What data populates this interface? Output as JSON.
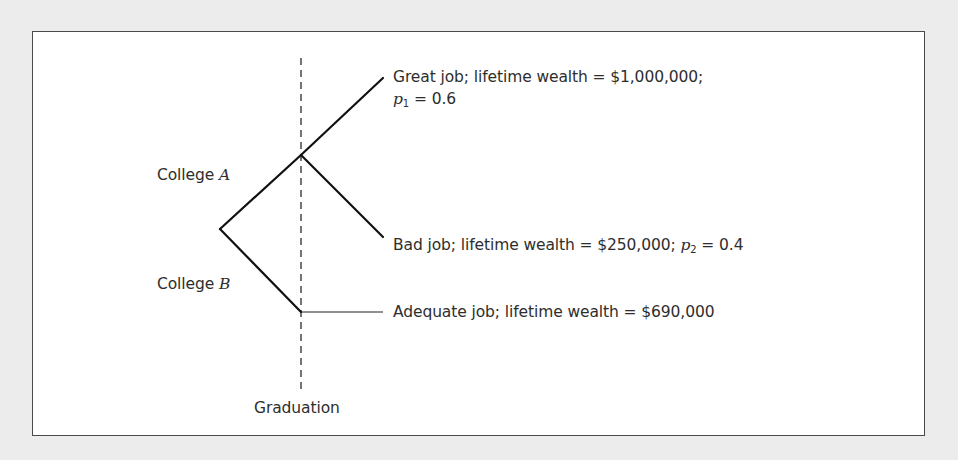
{
  "diagram": {
    "type": "decision-tree",
    "root": "decision",
    "divider_label": "Graduation",
    "branches": [
      {
        "label_prefix": "College ",
        "label_var": "A",
        "outcomes": [
          {
            "text": "Great job; lifetime wealth = $1,000,000;",
            "prob_var": "p",
            "prob_sub": "1",
            "prob_value": " = 0.6",
            "wealth": 1000000,
            "probability": 0.6
          },
          {
            "text": "Bad job; lifetime wealth = $250,000; ",
            "prob_var": "p",
            "prob_sub": "2",
            "prob_value": " = 0.4",
            "wealth": 250000,
            "probability": 0.4
          }
        ]
      },
      {
        "label_prefix": "College ",
        "label_var": "B",
        "outcomes": [
          {
            "text": "Adequate job; lifetime wealth = $690,000",
            "wealth": 690000,
            "probability": 1.0
          }
        ]
      }
    ]
  },
  "colors": {
    "background": "#ececec",
    "panel": "#ffffff",
    "line": "#1a1a1a",
    "text": "#2e2e2e"
  }
}
